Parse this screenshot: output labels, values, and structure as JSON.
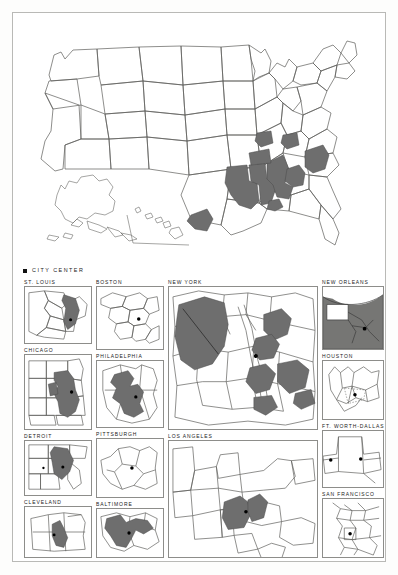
{
  "figure": {
    "legend": {
      "marker": "city-center-dot",
      "label": "CITY CENTER"
    },
    "shading_color": "#6e6e6e",
    "outline_color": "#5d5d5a",
    "background_color": "#ffffff"
  },
  "national_map": {
    "name": "united-states-map",
    "has_alaska_inset": true,
    "has_hawaii_inset": true,
    "shaded_states_or_regions": [
      "Louisiana",
      "Mississippi",
      "Alabama",
      "Arkansas (south)",
      "Tennessee (west)",
      "South Carolina",
      "Georgia (partial)",
      "Texas (south)"
    ],
    "unshaded_note": "Northern, Midwestern and Western states are unshaded"
  },
  "panels": [
    {
      "label": "ST. LOUIS",
      "column": 1,
      "shaded": true,
      "center_dot": true
    },
    {
      "label": "CHICAGO",
      "column": 1,
      "shaded": true,
      "center_dot": true
    },
    {
      "label": "DETROIT",
      "column": 1,
      "shaded": true,
      "center_dot": true
    },
    {
      "label": "CLEVELAND",
      "column": 1,
      "shaded": true,
      "center_dot": true
    },
    {
      "label": "BOSTON",
      "column": 2,
      "shaded": false,
      "center_dot": true
    },
    {
      "label": "PHILADELPHIA",
      "column": 2,
      "shaded": true,
      "center_dot": true
    },
    {
      "label": "PITTSBURGH",
      "column": 2,
      "shaded": false,
      "center_dot": true
    },
    {
      "label": "BALTIMORE",
      "column": 2,
      "shaded": true,
      "center_dot": true
    },
    {
      "label": "NEW YORK",
      "column": 3,
      "shaded": true,
      "center_dot": true
    },
    {
      "label": "LOS ANGELES",
      "column": 3,
      "shaded": true,
      "center_dot": true
    },
    {
      "label": "NEW ORLEANS",
      "column": 4,
      "shaded": true,
      "center_dot": true
    },
    {
      "label": "HOUSTON",
      "column": 4,
      "shaded": false,
      "center_dot": true
    },
    {
      "label": "FT. WORTH-DALLAS",
      "column": 4,
      "shaded": false,
      "center_dot": true
    },
    {
      "label": "SAN FRANCISCO",
      "column": 4,
      "shaded": false,
      "center_dot": true
    }
  ]
}
